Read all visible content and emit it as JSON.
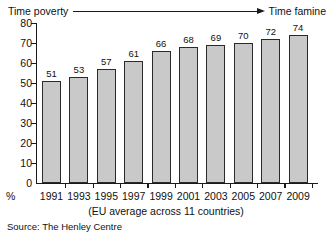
{
  "header": {
    "left_label": "Time poverty",
    "right_label": "Time famine",
    "arrow_icon": "right-arrow-icon"
  },
  "caption": "(EU average across 11 countries)",
  "source": "Source: The Henley Centre",
  "percent_symbol": "%",
  "colors": {
    "bar_fill": "#c9c9c9",
    "bar_stroke": "#2a2a2a",
    "axis": "#1a1a1a",
    "text": "#111111",
    "background": "#ffffff"
  },
  "chart_data": {
    "type": "bar",
    "title": "",
    "subtitle": "(EU average across 11 countries)",
    "xlabel": "",
    "ylabel": "%",
    "categories": [
      "1991",
      "1993",
      "1995",
      "1997",
      "1999",
      "2001",
      "2003",
      "2005",
      "2007",
      "2009"
    ],
    "values": [
      51,
      53,
      57,
      61,
      66,
      68,
      69,
      70,
      72,
      74
    ],
    "value_labels": [
      "51",
      "53",
      "57",
      "61",
      "66",
      "68",
      "69",
      "70",
      "72",
      "74"
    ],
    "ylim": [
      0,
      80
    ],
    "yticks": [
      0,
      10,
      20,
      30,
      40,
      50,
      60,
      70,
      80
    ],
    "ytick_labels": [
      "0",
      "10",
      "20",
      "30",
      "40",
      "50",
      "60",
      "70",
      "80"
    ],
    "grid": false,
    "legend": false,
    "legend_position": "none",
    "annotations": [
      "Time poverty",
      "Time famine"
    ],
    "source": "Source: The Henley Centre"
  }
}
